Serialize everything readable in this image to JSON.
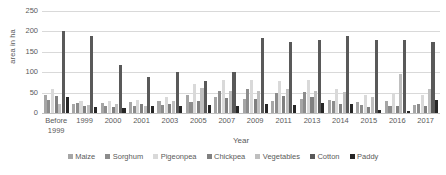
{
  "chart_data": {
    "type": "bar",
    "title": "",
    "xlabel": "Year",
    "ylabel": "area in ha",
    "ylim": [
      0,
      250
    ],
    "ytick_values": [
      250,
      200,
      150,
      100,
      50,
      0
    ],
    "ytick_labels": [
      "250",
      "200",
      "150",
      "100",
      "50",
      "0"
    ],
    "grid": true,
    "legend_position": "bottom",
    "categories": [
      "Before\n1999",
      "1999",
      "2000",
      "2001",
      "2003",
      "2005",
      "2007",
      "2009",
      "2011",
      "2013",
      "2014",
      "2015",
      "2016",
      "2017"
    ],
    "series": [
      {
        "name": "Maize",
        "color": "#a6a6a6",
        "values": [
          45,
          22,
          25,
          28,
          30,
          45,
          40,
          35,
          30,
          35,
          32,
          28,
          30,
          20
        ]
      },
      {
        "name": "Sorghum",
        "color": "#8c8c8c",
        "values": [
          32,
          25,
          18,
          18,
          20,
          28,
          55,
          60,
          50,
          52,
          30,
          20,
          18,
          22
        ]
      },
      {
        "name": "Pigeonpea",
        "color": "#d9d9d9",
        "values": [
          58,
          30,
          30,
          32,
          40,
          72,
          82,
          80,
          78,
          82,
          60,
          45,
          50,
          45
        ]
      },
      {
        "name": "Chickpea",
        "color": "#808080",
        "values": [
          42,
          18,
          15,
          22,
          22,
          30,
          38,
          35,
          42,
          40,
          22,
          15,
          18,
          18
        ]
      },
      {
        "name": "Vegetables",
        "color": "#bfbfbf",
        "values": [
          22,
          20,
          22,
          18,
          30,
          62,
          55,
          55,
          60,
          55,
          52,
          40,
          95,
          60
        ]
      },
      {
        "name": "Cotton",
        "color": "#595959",
        "values": [
          200,
          188,
          118,
          88,
          100,
          78,
          100,
          185,
          175,
          180,
          188,
          180,
          178,
          175
        ]
      },
      {
        "name": "Paddy",
        "color": "#262626",
        "values": [
          40,
          15,
          13,
          18,
          16,
          20,
          18,
          22,
          20,
          25,
          22,
          8,
          5,
          32
        ]
      }
    ]
  }
}
